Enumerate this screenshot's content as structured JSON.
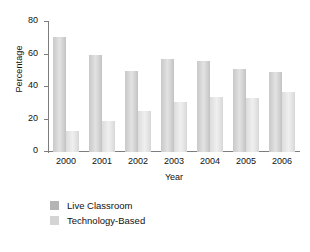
{
  "chart_data": {
    "type": "bar",
    "title": "",
    "xlabel": "Year",
    "ylabel": "Percentage",
    "categories": [
      "2000",
      "2001",
      "2002",
      "2003",
      "2004",
      "2005",
      "2006"
    ],
    "series": [
      {
        "name": "Live Classroom",
        "color": "#b4b4b4",
        "values": [
          71,
          60,
          50,
          57,
          56,
          51,
          49
        ]
      },
      {
        "name": "Technology-Based",
        "color": "#d4d4d4",
        "values": [
          13,
          19,
          25,
          31,
          34,
          33,
          37
        ]
      }
    ],
    "ylim": [
      0,
      80
    ],
    "yticks": [
      0,
      20,
      40,
      60,
      80
    ],
    "ytick_labels": [
      "0",
      "20",
      "40",
      "60",
      "80"
    ],
    "grid": false,
    "legend_position": "below-left"
  }
}
